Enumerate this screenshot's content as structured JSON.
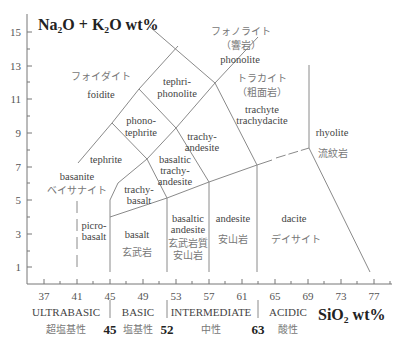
{
  "diagram": {
    "y_axis_title": "Na₂O + K₂O wt%",
    "x_axis_title": "SiO₂ wt%",
    "y_ticks": [
      "15",
      "13",
      "11",
      "9",
      "7",
      "5",
      "3",
      "1"
    ],
    "x_ticks": [
      "37",
      "41",
      "45",
      "49",
      "53",
      "57",
      "61",
      "65",
      "69",
      "73",
      "77"
    ],
    "fields": {
      "phonolite_jp": "フォノライト",
      "phonolite_jp2": "（響岩）",
      "phonolite": "phonolite",
      "foidite_jp": "フォイダイト",
      "foidite": "foidite",
      "tephriphonolite_1": "tephri-",
      "tephriphonolite_2": "phonolite",
      "trachyte_jp": "トラカイト",
      "trachyte_jp2": "（粗面岩）",
      "trachyte_1": "trachyte",
      "trachyte_2": "trachydacite",
      "phonotephrite_1": "phono-",
      "phonotephrite_2": "tephrite",
      "trachyandesite_1": "trachy-",
      "trachyandesite_2": "andesite",
      "rhyolite": "rhyolite",
      "rhyolite_jp": "流紋岩",
      "tephrite": "tephrite",
      "bta_1": "basaltic",
      "bta_2": "trachy-",
      "bta_3": "andesite",
      "basanite": "basanite",
      "basanite_jp": "ベイサナイト",
      "trachybasalt_1": "trachy-",
      "trachybasalt_2": "basalt",
      "picrobasalt_1": "picro-",
      "picrobasalt_2": "basalt",
      "basalt": "basalt",
      "basalt_jp": "玄武岩",
      "ba_1": "basaltic",
      "ba_2": "andesite",
      "ba_jp1": "玄武岩質",
      "ba_jp2": "安山岩",
      "andesite": "andesite",
      "andesite_jp": "安山岩",
      "dacite": "dacite",
      "dacite_jp": "デイサイト"
    },
    "classes": {
      "ultrabasic": "ULTRABASIC",
      "ultrabasic_jp": "超塩基性",
      "basic": "BASIC",
      "basic_jp": "塩基性",
      "intermediate": "INTERMEDIATE",
      "intermediate_jp": "中性",
      "acidic": "ACIDIC",
      "acidic_jp": "酸性",
      "b45": "45",
      "b52": "52",
      "b63": "63"
    },
    "colors": {
      "line": "#8a8a8a",
      "text": "#444444"
    }
  }
}
